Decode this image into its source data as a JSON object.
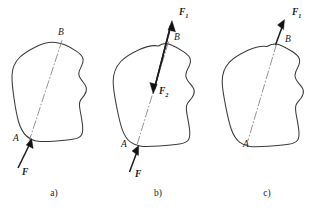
{
  "figure": {
    "background_color": "#ffffff",
    "outline_color": "#3b3b3b",
    "axis_color": "#8d8d8d",
    "force_color": "#121212"
  },
  "panels": [
    {
      "id": "a",
      "caption": "a)",
      "labels": {
        "point_b": "B",
        "point_a": "A",
        "force": "F"
      },
      "force_subscript": "",
      "description": "rigid body with line of action AB and force F applied at A pointing up toward A"
    },
    {
      "id": "b",
      "caption": "b)",
      "labels": {
        "point_b": "B",
        "point_a": "A",
        "force": "F",
        "force_one": "F",
        "force_one_sub": "1",
        "force_two": "F",
        "force_two_sub": "2"
      },
      "description": "same body showing equal and opposite forces F1 up beyond B and F2 down inside body along line AB, with original F at A"
    },
    {
      "id": "c",
      "caption": "c)",
      "labels": {
        "point_b": "B",
        "point_a": "A",
        "force_one": "F",
        "force_one_sub": "1"
      },
      "description": "body with single resultant force F1 transferred to point B along the same line of action"
    }
  ]
}
